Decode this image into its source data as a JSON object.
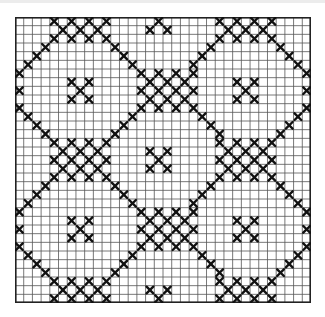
{
  "chart": {
    "title": "",
    "grid": {
      "cols": 34,
      "rows": 33
    },
    "colors": {
      "grid_line": "#555555",
      "border": "#222222",
      "stitch": "#111111",
      "background": "#ffffff"
    },
    "cluster_shape": {
      "half_rows": 2,
      "half_cols": 3
    },
    "clusters": [
      [
        0,
        7
      ],
      [
        0,
        26
      ],
      [
        8,
        17
      ],
      [
        16,
        7
      ],
      [
        16,
        26
      ],
      [
        24,
        17
      ],
      [
        32,
        7
      ],
      [
        32,
        26
      ]
    ],
    "motifs": [
      [
        0,
        16
      ],
      [
        8,
        7
      ],
      [
        8,
        26
      ],
      [
        16,
        16
      ],
      [
        24,
        7
      ],
      [
        24,
        26
      ],
      [
        32,
        16
      ]
    ],
    "diagonals": [
      [
        [
          3,
          11
        ],
        [
          5,
          13
        ]
      ],
      [
        [
          3,
          22
        ],
        [
          5,
          20
        ]
      ],
      [
        [
          11,
          13
        ],
        [
          13,
          11
        ]
      ],
      [
        [
          11,
          21
        ],
        [
          13,
          23
        ]
      ],
      [
        [
          19,
          11
        ],
        [
          21,
          13
        ]
      ],
      [
        [
          19,
          22
        ],
        [
          21,
          20
        ]
      ],
      [
        [
          27,
          13
        ],
        [
          29,
          11
        ]
      ],
      [
        [
          27,
          21
        ],
        [
          29,
          23
        ]
      ],
      [
        [
          3,
          3
        ],
        [
          6,
          0
        ]
      ],
      [
        [
          13,
          3
        ],
        [
          10,
          0
        ]
      ],
      [
        [
          19,
          3
        ],
        [
          22,
          0
        ]
      ],
      [
        [
          29,
          3
        ],
        [
          26,
          0
        ]
      ],
      [
        [
          3,
          30
        ],
        [
          6,
          33
        ]
      ],
      [
        [
          13,
          30
        ],
        [
          10,
          33
        ]
      ],
      [
        [
          19,
          30
        ],
        [
          22,
          33
        ]
      ],
      [
        [
          29,
          30
        ],
        [
          26,
          33
        ]
      ]
    ],
    "edge_stitches": [
      [
        8,
        0
      ],
      [
        10,
        0
      ],
      [
        24,
        0
      ],
      [
        26,
        0
      ],
      [
        8,
        33
      ],
      [
        10,
        33
      ],
      [
        24,
        33
      ],
      [
        26,
        33
      ]
    ]
  }
}
